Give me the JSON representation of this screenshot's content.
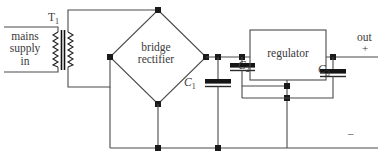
{
  "diagram": {
    "width": 389,
    "height": 164,
    "background": "#ffffff",
    "wire_color": "#4a4a4a",
    "node_color": "#1a1a1a"
  },
  "labels": {
    "mains_supply": "mains\nsupply\nin",
    "mains_line1": "mains",
    "mains_line2": "supply",
    "mains_line3": "in",
    "transformer": "T",
    "transformer_sub": "1",
    "bridge_line1": "bridge",
    "bridge_line2": "rectifier",
    "regulator": "regulator",
    "c1": "C",
    "c1_sub": "1",
    "c2": "C",
    "c2_sub": "2",
    "c3": "C",
    "c3_sub": "3",
    "out": "out",
    "polarity_plus": "+",
    "polarity_minus": "–"
  },
  "components": [
    {
      "id": "T1",
      "type": "transformer",
      "label": "T1"
    },
    {
      "id": "BR",
      "type": "bridge-rectifier",
      "label": "bridge rectifier"
    },
    {
      "id": "C1",
      "type": "polarized-capacitor",
      "label": "C1"
    },
    {
      "id": "C2",
      "type": "polarized-capacitor",
      "label": "C2"
    },
    {
      "id": "C3",
      "type": "polarized-capacitor",
      "label": "C3"
    },
    {
      "id": "REG",
      "type": "regulator-block",
      "label": "regulator"
    }
  ],
  "terminals": [
    {
      "id": "out-positive",
      "label": "out",
      "polarity": "+"
    },
    {
      "id": "out-negative",
      "label": "",
      "polarity": "–"
    }
  ]
}
